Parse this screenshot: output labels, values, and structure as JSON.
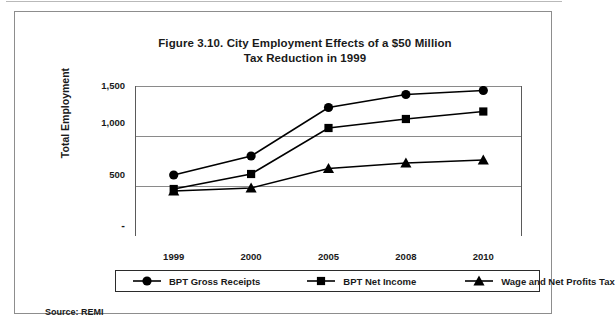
{
  "figure": {
    "title_line1": "Figure 3.10. City Employment Effects of a $50 Million",
    "title_line2": "Tax Reduction in 1999",
    "source": "Source: REMI"
  },
  "colors": {
    "ink": "#1a1a1a",
    "series": "#000000",
    "gridline": "#8a8a8a",
    "axis": "#5a5a5a",
    "frame": "#8d8d8d"
  },
  "chart_data": {
    "type": "line",
    "title": "Figure 3.10. City Employment Effects of a $50 Million Tax Reduction in 1999",
    "xlabel": "",
    "ylabel": "Total Employment",
    "categories": [
      "1999",
      "2000",
      "2005",
      "2008",
      "2010"
    ],
    "ylim": [
      0,
      1500
    ],
    "yticks": [
      0,
      500,
      1000,
      1500
    ],
    "ytick_labels": [
      "-",
      "500",
      "1,000",
      "1,500"
    ],
    "grid": true,
    "legend_position": "bottom",
    "series": [
      {
        "name": "BPT Gross Receipts",
        "marker": "circle",
        "values": [
          610,
          800,
          1285,
          1415,
          1455
        ]
      },
      {
        "name": "BPT Net Income",
        "marker": "square",
        "values": [
          470,
          620,
          1080,
          1170,
          1245
        ]
      },
      {
        "name": "Wage and Net Profits Tax",
        "marker": "triangle",
        "values": [
          450,
          480,
          675,
          730,
          760
        ]
      }
    ]
  }
}
